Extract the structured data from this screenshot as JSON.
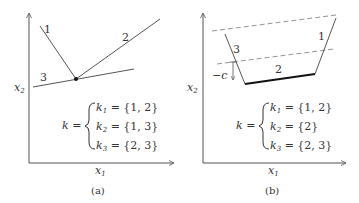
{
  "panel_a": {
    "caption": "(a)",
    "x_axis_label": "x",
    "x_axis_sub": "1",
    "y_axis_label": "x",
    "y_axis_sub": "2",
    "line_labels": [
      "1",
      "2",
      "3"
    ],
    "k_prefix": "k =",
    "cases": [
      {
        "var": "k",
        "sub": "1",
        "value": " = {1, 2}"
      },
      {
        "var": "k",
        "sub": "2",
        "value": " = {1, 3}"
      },
      {
        "var": "k",
        "sub": "3",
        "value": " = {2, 3}"
      }
    ]
  },
  "panel_b": {
    "caption": "(b)",
    "x_axis_label": "x",
    "x_axis_sub": "1",
    "y_axis_label": "x",
    "y_axis_sub": "2",
    "line_labels": [
      "1",
      "2",
      "3"
    ],
    "offset_label": "−c",
    "k_prefix": "k =",
    "cases": [
      {
        "var": "k",
        "sub": "1",
        "value": " = {1, 2}"
      },
      {
        "var": "k",
        "sub": "2",
        "value": " = {2}"
      },
      {
        "var": "k",
        "sub": "3",
        "value": " = {2, 3}"
      }
    ]
  },
  "colors": {
    "line": "#555555",
    "bold_line": "#222222",
    "dashed": "#888888",
    "text": "#333333"
  }
}
